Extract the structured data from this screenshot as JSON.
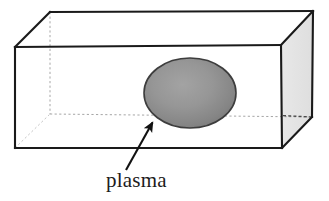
{
  "figure": {
    "kind": "3d-box-diagram",
    "title": "",
    "background_color": "#ffffff",
    "labels": [
      {
        "id": "plasma",
        "text": "plasma",
        "color": "#1c1c1c",
        "font_style": "serif",
        "x": 106,
        "y": 168
      }
    ],
    "box": {
      "name": "rectangular-chamber",
      "edge_color": "#1a1a1a",
      "front_face_color": "#ffffff",
      "top_face_color": "#ffffff",
      "side_face_color": "#e4e4e4",
      "hidden_edge_color": "#9a9a9a",
      "hidden_edge_style": "dashed",
      "vertices": {
        "front_top_left": [
          15,
          47
        ],
        "front_top_right": [
          281,
          45
        ],
        "front_bottom_left": [
          15,
          148
        ],
        "front_bottom_right": [
          282,
          148
        ],
        "back_top_left": [
          50,
          12
        ],
        "back_top_right": [
          313,
          11
        ],
        "back_bottom_left": [
          50,
          114
        ],
        "back_bottom_right": [
          312,
          117
        ]
      }
    },
    "ellipse": {
      "name": "plasma-region",
      "center": [
        190,
        93
      ],
      "radius_x": 46,
      "radius_y": 35,
      "fill_center_color": "#9a9a9a",
      "fill_edge_color": "#7b7b7b",
      "stroke_color": "#3d3d3d",
      "stroke_width": 1.6
    },
    "arrow": {
      "name": "plasma-pointer",
      "color": "#121212",
      "from": [
        126,
        170
      ],
      "to": [
        151,
        121
      ],
      "line_width": 2.1,
      "head_length": 13,
      "head_width": 9
    }
  }
}
